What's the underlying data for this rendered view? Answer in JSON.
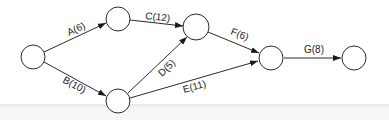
{
  "diagram": {
    "type": "activity-on-arrow network",
    "nodes": [
      {
        "id": "n1",
        "cx": 33,
        "cy": 57
      },
      {
        "id": "n2",
        "cx": 118,
        "cy": 19
      },
      {
        "id": "n3",
        "cx": 118,
        "cy": 101
      },
      {
        "id": "n4",
        "cx": 196,
        "cy": 27
      },
      {
        "id": "n5",
        "cx": 271,
        "cy": 58
      },
      {
        "id": "n6",
        "cx": 354,
        "cy": 58
      }
    ],
    "edges": [
      {
        "label": "A(6)",
        "from": "n1",
        "to": "n2"
      },
      {
        "label": "B(10)",
        "from": "n1",
        "to": "n3"
      },
      {
        "label": "C(12)",
        "from": "n2",
        "to": "n4"
      },
      {
        "label": "D(5)",
        "from": "n3",
        "to": "n4"
      },
      {
        "label": "E(11)",
        "from": "n3",
        "to": "n5"
      },
      {
        "label": "F(6)",
        "from": "n4",
        "to": "n5"
      },
      {
        "label": "G(8)",
        "from": "n5",
        "to": "n6"
      }
    ]
  }
}
